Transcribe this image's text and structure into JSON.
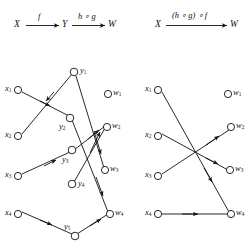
{
  "figure": {
    "background": "#ffffff",
    "stroke": "#111111",
    "node_fill": "#ffffff"
  },
  "left_panel": {
    "arrow_diagram": {
      "source_label": "X",
      "middle_label": "Y",
      "target_label": "W",
      "first_arrow_label": "f",
      "second_arrow_label": "h ∘ g"
    },
    "columns": {
      "x_nodes": [
        "x1",
        "x2",
        "x3",
        "x4"
      ],
      "y_nodes": [
        "y1",
        "y2",
        "y3",
        "y4",
        "y5"
      ],
      "w_nodes": [
        "w1",
        "w2",
        "w3",
        "w4"
      ]
    },
    "x_labels": [
      "x",
      "x",
      "x",
      "x"
    ],
    "x_subs": [
      "1",
      "2",
      "3",
      "4"
    ],
    "y_labels": [
      "y",
      "y",
      "y",
      "y",
      "y"
    ],
    "y_subs": [
      "1",
      "2",
      "3",
      "4",
      "5"
    ],
    "w_labels": [
      "w",
      "w",
      "w",
      "w"
    ],
    "w_subs": [
      "1",
      "2",
      "3",
      "4"
    ],
    "edges": [
      {
        "from": "x1",
        "to": "y2"
      },
      {
        "from": "x2",
        "to": "y1"
      },
      {
        "from": "x3",
        "to": "y3"
      },
      {
        "from": "x4",
        "to": "y5"
      },
      {
        "from": "y1",
        "to": "w3"
      },
      {
        "from": "y2",
        "to": "w4"
      },
      {
        "from": "y3",
        "to": "w2"
      },
      {
        "from": "y4",
        "to": "w2"
      },
      {
        "from": "y5",
        "to": "w4"
      }
    ]
  },
  "right_panel": {
    "arrow_diagram": {
      "source_label": "X",
      "target_label": "W",
      "arrow_label": "(h ∘ g) ∘ f"
    },
    "columns": {
      "x_nodes": [
        "x1",
        "x2",
        "x3",
        "x4"
      ],
      "w_nodes": [
        "w1",
        "w2",
        "w3",
        "w4"
      ]
    },
    "x_labels": [
      "x",
      "x",
      "x",
      "x"
    ],
    "x_subs": [
      "1",
      "2",
      "3",
      "4"
    ],
    "w_labels": [
      "w",
      "w",
      "w",
      "w"
    ],
    "w_subs": [
      "1",
      "2",
      "3",
      "4"
    ],
    "edges": [
      {
        "from": "x1",
        "to": "w4"
      },
      {
        "from": "x2",
        "to": "w3"
      },
      {
        "from": "x3",
        "to": "w2"
      },
      {
        "from": "x4",
        "to": "w4"
      }
    ]
  }
}
